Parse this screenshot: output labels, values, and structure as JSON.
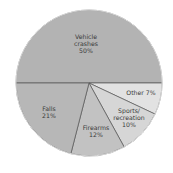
{
  "chart_data": {
    "type": "pie",
    "title": "",
    "center": [
      89,
      83
    ],
    "radius": 73,
    "start_angle_deg": 180,
    "direction": "clockwise-from-left-through-top",
    "slices": [
      {
        "label": "Vehicle crashes",
        "value": 50,
        "color": "#b3b3b3",
        "label_lines": [
          "Vehicle",
          "crashes",
          "50%"
        ],
        "label_pos": [
          86,
          39
        ]
      },
      {
        "label": "Other",
        "value": 7,
        "color": "#e2e2e2",
        "label_lines": [
          "Other 7%"
        ],
        "label_pos": [
          141,
          95
        ]
      },
      {
        "label": "Sports/recreation",
        "value": 10,
        "color": "#d6d6d6",
        "label_lines": [
          "Sports/",
          "recreation",
          "10%"
        ],
        "label_pos": [
          129,
          113
        ]
      },
      {
        "label": "Firearms",
        "value": 12,
        "color": "#c2c2c2",
        "label_lines": [
          "Firearms",
          "12%"
        ],
        "label_pos": [
          96,
          130
        ]
      },
      {
        "label": "Falls",
        "value": 21,
        "color": "#b7b7b7",
        "label_lines": [
          "Falls",
          "21%"
        ],
        "label_pos": [
          49,
          111
        ]
      }
    ],
    "stroke_color": "#555555",
    "legend": null
  }
}
